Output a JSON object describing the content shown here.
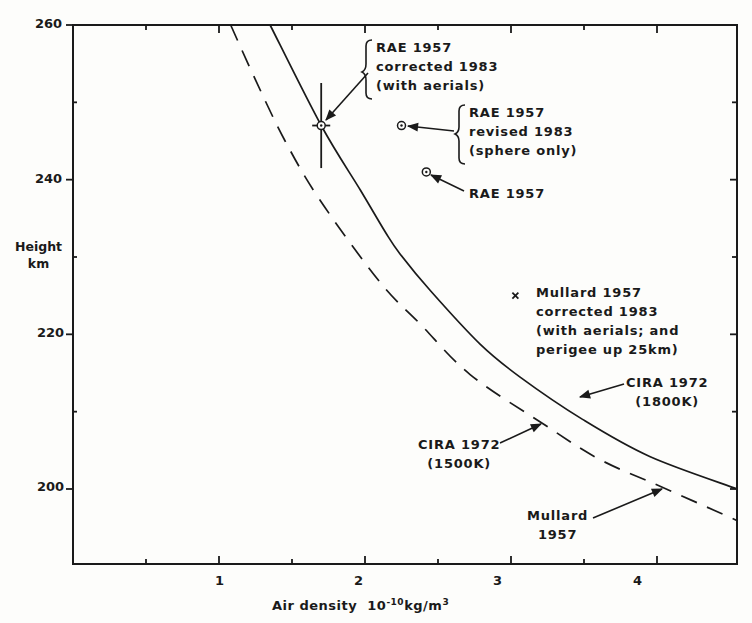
{
  "chart_data": {
    "type": "line",
    "title": "",
    "xlabel": "Air density 10^-10 kg/m^3",
    "xlabel_parts": {
      "text": "Air density",
      "base": "10",
      "exp": "-10",
      "unit": "kg/m",
      "unit_exp": "3"
    },
    "ylabel": "Height km",
    "ylabel_lines": [
      "Height",
      "km"
    ],
    "xlim": [
      0,
      4.6
    ],
    "ylim": [
      190.3,
      260
    ],
    "x_ticks": [
      1,
      2,
      3,
      4
    ],
    "x_minor_ticks": [
      0.5,
      1.5,
      2.5,
      3.5
    ],
    "y_ticks": [
      200,
      220,
      240,
      260
    ],
    "y_minor_ticks": [
      210,
      230,
      250
    ],
    "grid": false,
    "series": [
      {
        "name": "CIRA 1972 (1800K)",
        "style": "solid",
        "points": [
          [
            1.35,
            260
          ],
          [
            1.7,
            247
          ],
          [
            1.97,
            238.6
          ],
          [
            2.14,
            233.2
          ],
          [
            2.24,
            230.4
          ],
          [
            2.45,
            225.6
          ],
          [
            2.79,
            218.7
          ],
          [
            3.06,
            214.5
          ],
          [
            3.49,
            209.0
          ],
          [
            3.95,
            204.2
          ],
          [
            4.55,
            200
          ]
        ]
      },
      {
        "name": "CIRA 1972 (1500K)",
        "style": "dashed",
        "points": [
          [
            1.08,
            260
          ],
          [
            1.25,
            252.9
          ],
          [
            1.45,
            245.1
          ],
          [
            1.69,
            237.4
          ],
          [
            2.1,
            226.8
          ],
          [
            2.38,
            221.3
          ],
          [
            2.72,
            214.8
          ],
          [
            3.23,
            208.3
          ],
          [
            3.61,
            203.8
          ],
          [
            4.04,
            200.2
          ],
          [
            4.55,
            195.9
          ]
        ]
      },
      {
        "name": "RAE 1957 corrected 1983 (with aerials)",
        "style": "marker-circle-errorbar",
        "points": [
          [
            1.7,
            247
          ]
        ],
        "error": {
          "x": 0.35,
          "y": 5.5
        }
      },
      {
        "name": "RAE 1957 revised 1983 (sphere only)",
        "style": "marker-circle",
        "points": [
          [
            2.25,
            247
          ]
        ]
      },
      {
        "name": "RAE 1957",
        "style": "marker-circle",
        "points": [
          [
            2.42,
            241
          ]
        ]
      },
      {
        "name": "Mullard 1957 corrected 1983 (with aerials; and perigee up 25km)",
        "style": "marker-x",
        "points": [
          [
            3.03,
            225
          ]
        ]
      },
      {
        "name": "Mullard 1957",
        "style": "point-on-curve",
        "points": [
          [
            4.04,
            200
          ]
        ]
      }
    ],
    "annotations": [
      {
        "lines": [
          "RAE 1957",
          "corrected 1983",
          "(with aerials)"
        ],
        "brace": true
      },
      {
        "lines": [
          "RAE 1957",
          "revised 1983",
          "(sphere only)"
        ],
        "brace": true
      },
      {
        "lines": [
          "RAE 1957"
        ],
        "brace": false
      },
      {
        "lines": [
          "Mullard 1957",
          "corrected 1983",
          "(with aerials; and",
          " perigee up 25km)"
        ],
        "brace": false
      },
      {
        "lines": [
          "CIRA 1972",
          "(1800K)"
        ],
        "brace": false
      },
      {
        "lines": [
          "CIRA 1972",
          "(1500K)"
        ],
        "brace": false
      },
      {
        "lines": [
          "Mullard",
          "1957"
        ],
        "brace": false
      }
    ]
  },
  "labels": {
    "y_ticks": [
      "260",
      "240",
      "220",
      "200"
    ],
    "x_ticks": [
      "1",
      "2",
      "3",
      "4"
    ],
    "ylabel": [
      "Height",
      "km"
    ],
    "xlabel_text": "Air density",
    "xlabel_base": "10",
    "xlabel_exp": "-10",
    "xlabel_unit": "kg/m",
    "xlabel_unit_exp": "3",
    "ann_rae_corr": [
      "RAE 1957",
      "corrected 1983",
      "(with aerials)"
    ],
    "ann_rae_rev": [
      "RAE 1957",
      "revised 1983",
      "(sphere only)"
    ],
    "ann_rae": [
      "RAE 1957"
    ],
    "ann_mullard_corr": [
      "Mullard 1957",
      "corrected 1983",
      "(with aerials; and",
      " perigee up 25km)"
    ],
    "ann_cira1800": [
      "CIRA 1972",
      "(1800K)"
    ],
    "ann_cira1500": [
      "CIRA 1972",
      "(1500K)"
    ],
    "ann_mullard": [
      "Mullard",
      "1957"
    ]
  },
  "colors": {
    "ink": "#1a1a1a",
    "paper": "#fdfdfb"
  }
}
